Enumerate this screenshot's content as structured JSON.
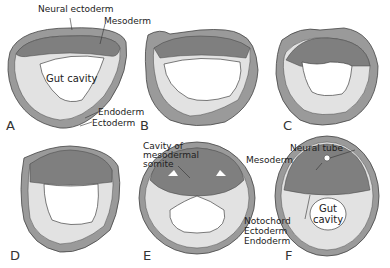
{
  "colors": {
    "ectoderm": "#9a9a9a",
    "mesoderm": "#7f7f7f",
    "endoderm": "#e2e2e2",
    "outline": "#444444",
    "background": "#ffffff"
  },
  "panels": [
    {
      "letter": "A",
      "labels": {
        "neural_ectoderm": "Neural ectoderm",
        "mesoderm": "Mesoderm",
        "gut_cavity": "Gut cavity",
        "endoderm": "Endoderm",
        "ectoderm": "Ectoderm"
      }
    },
    {
      "letter": "B"
    },
    {
      "letter": "C"
    },
    {
      "letter": "D"
    },
    {
      "letter": "E",
      "labels": {
        "cavity_somite_1": "Cavity of",
        "cavity_somite_2": "mesodermal",
        "cavity_somite_3": "somite"
      }
    },
    {
      "letter": "F",
      "labels": {
        "neural_tube": "Neural tube",
        "mesoderm": "Mesoderm",
        "notochord": "Notochord",
        "ectoderm": "Ectoderm",
        "endoderm": "Endoderm",
        "gut_1": "Gut",
        "gut_2": "cavity"
      }
    }
  ]
}
